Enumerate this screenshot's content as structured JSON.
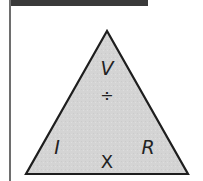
{
  "diagram": {
    "type": "formula-triangle",
    "title": "",
    "top_label": "V",
    "operator_top": "÷",
    "bottom_left_label": "I",
    "bottom_right_label": "R",
    "operator_bottom": "X",
    "colors": {
      "fill": "#d6d6d6",
      "stroke": "#1e1e1e",
      "top_bar": "#3a3a3a",
      "left_rule": "#6e6e6e"
    }
  }
}
